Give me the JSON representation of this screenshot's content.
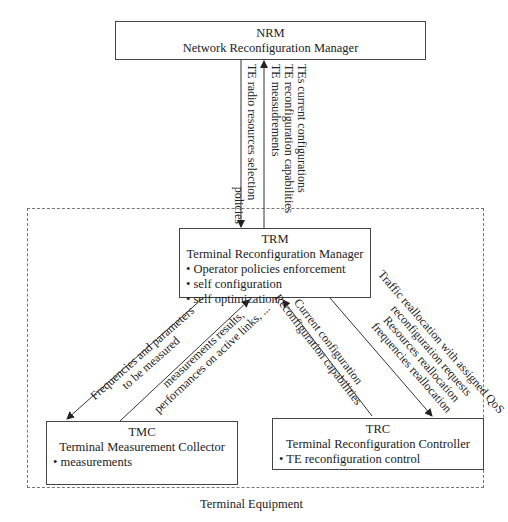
{
  "nrm": {
    "abbr": "NRM",
    "name": "Network Reconfiguration Manager"
  },
  "trm": {
    "abbr": "TRM",
    "name": "Terminal Reconfiguration Manager",
    "items": [
      "• Operator policies enforcement",
      "• self configuration",
      "• self optimization"
    ]
  },
  "tmc": {
    "abbr": "TMC",
    "name": "Terminal Measurement Collector",
    "items": [
      "• measurements"
    ]
  },
  "trc": {
    "abbr": "TRC",
    "name": "Terminal Reconfiguration Controller",
    "items": [
      "• TE reconfiguration control"
    ]
  },
  "container": {
    "label": "Terminal Equipment"
  },
  "edges": {
    "nrm_to_trm": [
      "TE radio resources selection",
      "policies"
    ],
    "trm_to_nrm": [
      "TEs current configurations",
      "TE reconfiguration capabilities",
      "TE measudrements"
    ],
    "trm_to_tmc": [
      "Frequencies and parameters",
      "to be measured"
    ],
    "tmc_to_trm": [
      "measurements results,",
      "performances on active links, ..."
    ],
    "trc_to_trm": [
      "Current configuration",
      "Reconfiguration capabilities"
    ],
    "trm_to_trc": [
      "Traffic reallocation with assigned QoS",
      "reconfiguration requests",
      "Resources reallocation",
      "frequencies reallocation"
    ]
  }
}
